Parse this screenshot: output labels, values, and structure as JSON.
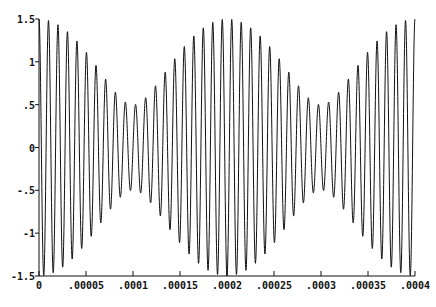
{
  "chart_data": {
    "type": "line",
    "title": "",
    "xlabel": "",
    "ylabel": "",
    "xlim": [
      0,
      0.0004
    ],
    "ylim": [
      -1.5,
      1.5
    ],
    "grid": false,
    "legend": null,
    "x_ticks": [
      "0",
      ".00005",
      ".0001",
      ".00015",
      ".0002",
      ".00025",
      ".0003",
      ".00035",
      ".0004"
    ],
    "x_tick_values": [
      0,
      5e-05,
      0.0001,
      0.00015,
      0.0002,
      0.00025,
      0.0003,
      0.00035,
      0.0004
    ],
    "y_ticks": [
      "-1.5",
      "-1",
      "-.5",
      "0",
      ".5",
      "1",
      "1.5"
    ],
    "y_tick_values": [
      -1.5,
      -1,
      -0.5,
      0,
      0.5,
      1,
      1.5
    ],
    "series": [
      {
        "name": "beat signal",
        "description": "sum of two sinusoids: 1.0*cos(2*pi*97500*t) + 0.5*cos(2*pi*102500*t); carrier ~100 kHz (~40 cycles), envelope max 1.5 at t=0, .0002, .0004 and min 0.5 at t=.0001, .0003",
        "components": [
          {
            "amplitude": 1.0,
            "frequency_hz": 97500
          },
          {
            "amplitude": 0.5,
            "frequency_hz": 102500
          }
        ],
        "envelope": {
          "max": 1.5,
          "min": 0.5,
          "beat_period": 0.0002
        },
        "color": "#111111"
      }
    ]
  }
}
